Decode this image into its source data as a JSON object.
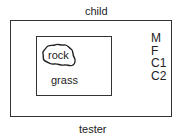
{
  "diagram": {
    "top_label": "child",
    "bottom_label": "tester",
    "inner_region": {
      "object_label": "rock",
      "surface_label": "grass"
    },
    "legend_items": [
      "M",
      "F",
      "C1",
      "C2"
    ]
  }
}
